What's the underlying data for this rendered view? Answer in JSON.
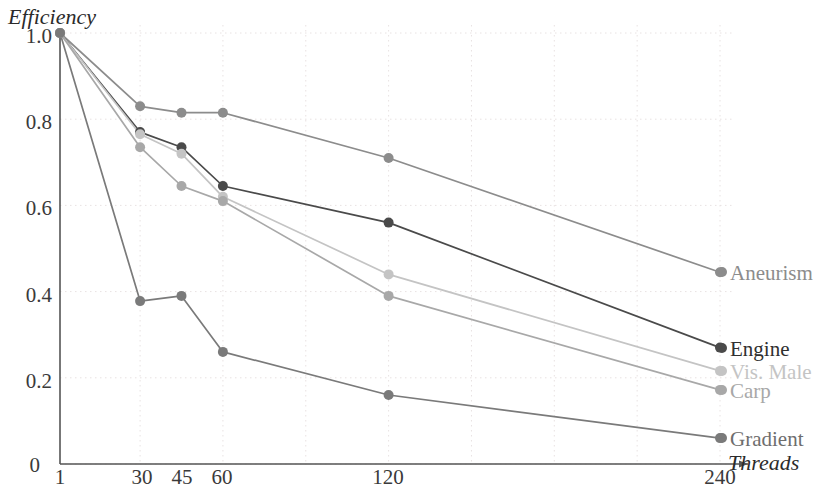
{
  "chart_data": {
    "type": "line",
    "title": "",
    "xlabel": "Threads",
    "ylabel": "Efficiency",
    "x": [
      1,
      30,
      45,
      60,
      120,
      240
    ],
    "xticks": [
      "1",
      "30",
      "45",
      "60",
      "120",
      "240"
    ],
    "yticks": [
      "0",
      "0.2",
      "0.4",
      "0.6",
      "0.8",
      "1.0"
    ],
    "xlim": [
      1,
      240
    ],
    "ylim": [
      0,
      1.0
    ],
    "grid": true,
    "legend_position": "right-inline",
    "series": [
      {
        "name": "Aneurism",
        "color": "#8c8c8c",
        "values": [
          1.0,
          0.83,
          0.815,
          0.815,
          0.71,
          0.445
        ]
      },
      {
        "name": "Engine",
        "color": "#4a4a4a",
        "values": [
          1.0,
          0.77,
          0.735,
          0.645,
          0.56,
          0.27
        ]
      },
      {
        "name": "Vis. Male",
        "color": "#c4c4c4",
        "values": [
          1.0,
          0.765,
          0.72,
          0.62,
          0.44,
          0.216
        ]
      },
      {
        "name": "Carp",
        "color": "#a8a8a8",
        "values": [
          1.0,
          0.735,
          0.645,
          0.61,
          0.39,
          0.172
        ]
      },
      {
        "name": "Gradient",
        "color": "#7a7a7a",
        "values": [
          1.0,
          0.378,
          0.39,
          0.26,
          0.16,
          0.06
        ]
      }
    ]
  },
  "axis": {
    "y_label": "Efficiency",
    "x_label": "Threads",
    "y_ticks": [
      "1.0",
      "0.8",
      "0.6",
      "0.4",
      "0.2",
      "0"
    ],
    "x_ticks": [
      "1",
      "30",
      "45",
      "60",
      "120",
      "240"
    ]
  },
  "labels": {
    "aneurism": "Aneurism",
    "engine": "Engine",
    "vis_male": "Vis. Male",
    "carp": "Carp",
    "gradient": "Gradient"
  },
  "colors": {
    "aneurism": "#8c8c8c",
    "engine": "#4a4a4a",
    "vis_male": "#c4c4c4",
    "carp": "#a8a8a8",
    "gradient": "#7a7a7a",
    "axis": "#555555",
    "grid": "#e8e2e2"
  }
}
